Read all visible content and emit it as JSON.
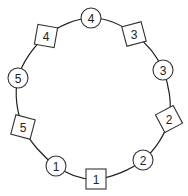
{
  "diagram": {
    "type": "ring",
    "ring": {
      "cx": 94,
      "cy": 99,
      "rx": 76,
      "ry": 81
    },
    "nodes": [
      {
        "id": "circle-4",
        "shape": "circle",
        "label": "4",
        "x": 91,
        "y": 18,
        "rotation": 0
      },
      {
        "id": "square-3",
        "shape": "square",
        "label": "3",
        "x": 134,
        "y": 34,
        "rotation": -15
      },
      {
        "id": "circle-3",
        "shape": "circle",
        "label": "3",
        "x": 163,
        "y": 70,
        "rotation": 0
      },
      {
        "id": "square-2",
        "shape": "square",
        "label": "2",
        "x": 169,
        "y": 119,
        "rotation": -28
      },
      {
        "id": "circle-2",
        "shape": "circle",
        "label": "2",
        "x": 143,
        "y": 160,
        "rotation": 0
      },
      {
        "id": "square-1",
        "shape": "square",
        "label": "1",
        "x": 96,
        "y": 179,
        "rotation": 0
      },
      {
        "id": "circle-1",
        "shape": "circle",
        "label": "1",
        "x": 56,
        "y": 166,
        "rotation": 0
      },
      {
        "id": "square-5",
        "shape": "square",
        "label": "5",
        "x": 23,
        "y": 127,
        "rotation": 15
      },
      {
        "id": "circle-5",
        "shape": "circle",
        "label": "5",
        "x": 18,
        "y": 78,
        "rotation": 0
      },
      {
        "id": "square-4",
        "shape": "square",
        "label": "4",
        "x": 46,
        "y": 36,
        "rotation": 10
      }
    ]
  }
}
